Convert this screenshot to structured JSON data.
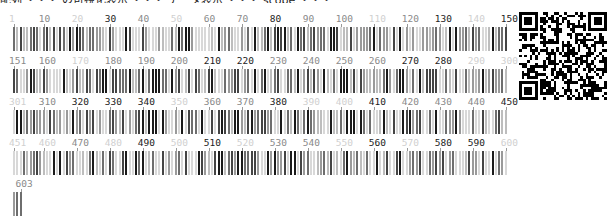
{
  "header": {
    "clipped_text": "配列 ・・・ の可視化表示 ・・・ データ表示 ・・・ scope ・・・"
  },
  "viewer": {
    "positions_per_row": 150,
    "sequence_length": 603,
    "start_x": 13,
    "step_px": 3.3,
    "shade_colors": {
      "L": "#d0d0d0",
      "M": "#8a8a8a",
      "D": "#222222"
    },
    "rows": [
      {
        "top": 13,
        "start": 1,
        "end": 150,
        "seed": 11,
        "labels": [
          [
            "1",
            "L"
          ],
          [
            "10",
            "M"
          ],
          [
            "20",
            "L"
          ],
          [
            "30",
            "D"
          ],
          [
            "40",
            "M"
          ],
          [
            "50",
            "L"
          ],
          [
            "60",
            "M"
          ],
          [
            "70",
            "M"
          ],
          [
            "80",
            "D"
          ],
          [
            "90",
            "M"
          ],
          [
            "100",
            "M"
          ],
          [
            "110",
            "L"
          ],
          [
            "120",
            "M"
          ],
          [
            "130",
            "D"
          ],
          [
            "140",
            "L"
          ],
          [
            "150",
            "D"
          ]
        ]
      },
      {
        "top": 55,
        "start": 151,
        "end": 300,
        "seed": 23,
        "labels": [
          [
            "151",
            "M"
          ],
          [
            "160",
            "M"
          ],
          [
            "170",
            "L"
          ],
          [
            "180",
            "M"
          ],
          [
            "190",
            "M"
          ],
          [
            "200",
            "M"
          ],
          [
            "210",
            "D"
          ],
          [
            "220",
            "D"
          ],
          [
            "230",
            "M"
          ],
          [
            "240",
            "M"
          ],
          [
            "250",
            "M"
          ],
          [
            "260",
            "M"
          ],
          [
            "270",
            "D"
          ],
          [
            "280",
            "D"
          ],
          [
            "290",
            "L"
          ],
          [
            "300",
            "L"
          ]
        ]
      },
      {
        "top": 96,
        "start": 301,
        "end": 450,
        "seed": 37,
        "labels": [
          [
            "301",
            "L"
          ],
          [
            "310",
            "M"
          ],
          [
            "320",
            "D"
          ],
          [
            "330",
            "D"
          ],
          [
            "340",
            "D"
          ],
          [
            "350",
            "L"
          ],
          [
            "360",
            "M"
          ],
          [
            "370",
            "M"
          ],
          [
            "380",
            "D"
          ],
          [
            "390",
            "L"
          ],
          [
            "400",
            "L"
          ],
          [
            "410",
            "D"
          ],
          [
            "420",
            "M"
          ],
          [
            "430",
            "M"
          ],
          [
            "440",
            "M"
          ],
          [
            "450",
            "D"
          ]
        ]
      },
      {
        "top": 137,
        "start": 451,
        "end": 600,
        "seed": 53,
        "labels": [
          [
            "451",
            "L"
          ],
          [
            "460",
            "L"
          ],
          [
            "470",
            "M"
          ],
          [
            "480",
            "L"
          ],
          [
            "490",
            "D"
          ],
          [
            "500",
            "L"
          ],
          [
            "510",
            "D"
          ],
          [
            "520",
            "L"
          ],
          [
            "530",
            "M"
          ],
          [
            "540",
            "M"
          ],
          [
            "550",
            "L"
          ],
          [
            "560",
            "D"
          ],
          [
            "570",
            "L"
          ],
          [
            "580",
            "D"
          ],
          [
            "590",
            "D"
          ],
          [
            "600",
            "L"
          ]
        ]
      },
      {
        "top": 178,
        "start": 601,
        "end": 603,
        "seed": 71,
        "labels": [
          [
            "603",
            "M"
          ]
        ]
      }
    ]
  },
  "qr_code": {
    "label": "qr-code",
    "modules": 33,
    "seed": 97
  }
}
